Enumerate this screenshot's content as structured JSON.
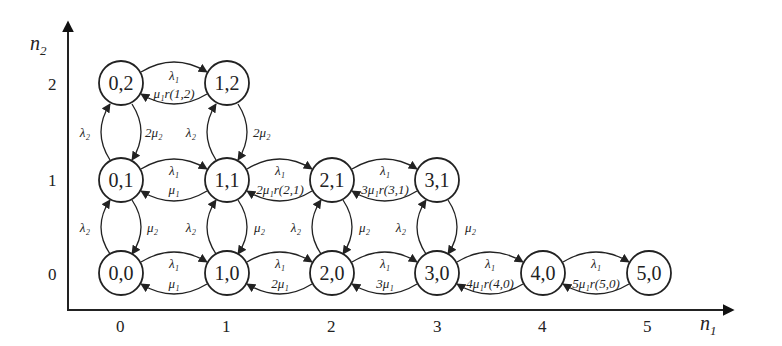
{
  "diagram": {
    "axes": {
      "x": {
        "label_main": "n",
        "label_sub": "1",
        "ticks": [
          "0",
          "1",
          "2",
          "3",
          "4",
          "5"
        ]
      },
      "y": {
        "label_main": "n",
        "label_sub": "2",
        "ticks": [
          "0",
          "1",
          "2"
        ]
      }
    },
    "nodes": [
      {
        "id": "0,2",
        "label": "0,2",
        "n1": 0,
        "n2": 2
      },
      {
        "id": "1,2",
        "label": "1,2",
        "n1": 1,
        "n2": 2
      },
      {
        "id": "0,1",
        "label": "0,1",
        "n1": 0,
        "n2": 1
      },
      {
        "id": "1,1",
        "label": "1,1",
        "n1": 1,
        "n2": 1
      },
      {
        "id": "2,1",
        "label": "2,1",
        "n1": 2,
        "n2": 1
      },
      {
        "id": "3,1",
        "label": "3,1",
        "n1": 3,
        "n2": 1
      },
      {
        "id": "0,0",
        "label": "0,0",
        "n1": 0,
        "n2": 0
      },
      {
        "id": "1,0",
        "label": "1,0",
        "n1": 1,
        "n2": 0
      },
      {
        "id": "2,0",
        "label": "2,0",
        "n1": 2,
        "n2": 0
      },
      {
        "id": "3,0",
        "label": "3,0",
        "n1": 3,
        "n2": 0
      },
      {
        "id": "4,0",
        "label": "4,0",
        "n1": 4,
        "n2": 0
      },
      {
        "id": "5,0",
        "label": "5,0",
        "n1": 5,
        "n2": 0
      }
    ],
    "horizontal_edges": [
      {
        "from": "0,2",
        "to": "1,2",
        "forward": "λ₁",
        "backward": "μ₁r(1,2)"
      },
      {
        "from": "0,1",
        "to": "1,1",
        "forward": "λ₁",
        "backward": "μ₁"
      },
      {
        "from": "1,1",
        "to": "2,1",
        "forward": "λ₁",
        "backward": "2μ₁r(2,1)"
      },
      {
        "from": "2,1",
        "to": "3,1",
        "forward": "λ₁",
        "backward": "3μ₁r(3,1)"
      },
      {
        "from": "0,0",
        "to": "1,0",
        "forward": "λ₁",
        "backward": "μ₁"
      },
      {
        "from": "1,0",
        "to": "2,0",
        "forward": "λ₁",
        "backward": "2μ₁"
      },
      {
        "from": "2,0",
        "to": "3,0",
        "forward": "λ₁",
        "backward": "3μ₁"
      },
      {
        "from": "3,0",
        "to": "4,0",
        "forward": "λ₁",
        "backward": "4μ₁r(4,0)"
      },
      {
        "from": "4,0",
        "to": "5,0",
        "forward": "λ₁",
        "backward": "5μ₁r(5,0)"
      }
    ],
    "vertical_edges": [
      {
        "from": "0,1",
        "to": "0,2",
        "up": "λ₂",
        "down": "2μ₂"
      },
      {
        "from": "1,1",
        "to": "1,2",
        "up": "λ₂",
        "down": "2μ₂"
      },
      {
        "from": "0,0",
        "to": "0,1",
        "up": "λ₂",
        "down": "μ₂"
      },
      {
        "from": "1,0",
        "to": "1,1",
        "up": "λ₂",
        "down": "μ₂"
      },
      {
        "from": "2,0",
        "to": "2,1",
        "up": "λ₂",
        "down": "μ₂"
      },
      {
        "from": "3,0",
        "to": "3,1",
        "up": "λ₂",
        "down": "μ₂"
      }
    ]
  }
}
